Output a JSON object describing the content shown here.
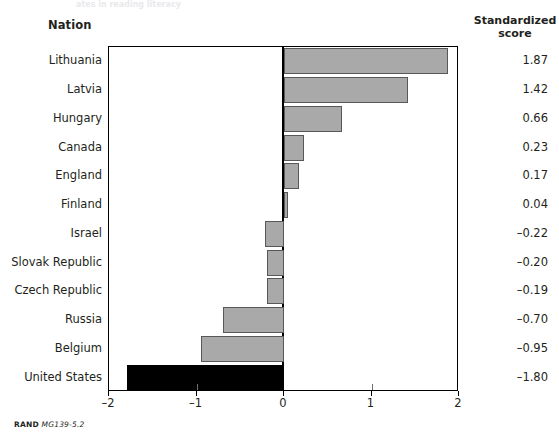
{
  "figure": {
    "top_sliver_text": "ates in reading literacy",
    "nation_header": "Nation",
    "score_header_line1": "Standardized",
    "score_header_line2": "score",
    "footer_brand": "RAND",
    "footer_code": "MG139-5.2",
    "highlight_color": "#000000",
    "bar_color": "#a9a9a9",
    "bar_border_color": "#58585a",
    "axis_color": "#000000"
  },
  "chart_data": {
    "type": "bar",
    "orientation": "horizontal",
    "title": "",
    "xlabel": "",
    "ylabel": "Nation",
    "xlim": [
      -2,
      2
    ],
    "xticks": [
      -2,
      -1,
      0,
      1,
      2
    ],
    "xticklabels": [
      "–2",
      "–1",
      "0",
      "1",
      "2"
    ],
    "grid": false,
    "legend": null,
    "value_column_header": "Standardized score",
    "categories": [
      "Lithuania",
      "Latvia",
      "Hungary",
      "Canada",
      "England",
      "Finland",
      "Israel",
      "Slovak Republic",
      "Czech Republic",
      "Russia",
      "Belgium",
      "United States"
    ],
    "values": [
      1.87,
      1.42,
      0.66,
      0.23,
      0.17,
      0.04,
      -0.22,
      -0.2,
      -0.19,
      -0.7,
      -0.95,
      -1.8
    ],
    "value_labels": [
      "1.87",
      "1.42",
      "0.66",
      "0.23",
      "0.17",
      "0.04",
      "–0.22",
      "–0.20",
      "–0.19",
      "–0.70",
      "–0.95",
      "–1.80"
    ],
    "highlighted_categories": [
      "United States"
    ]
  }
}
